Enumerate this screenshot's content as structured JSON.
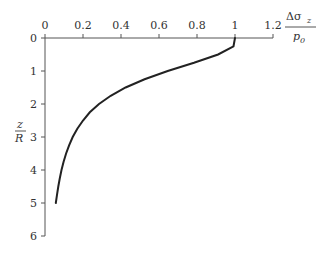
{
  "chart_data": {
    "type": "line",
    "title": "",
    "xlabel": "Δσ_z / p_0",
    "ylabel": "z / R",
    "x_axis_position": "top",
    "y_axis_inverted": true,
    "xlim": [
      0,
      1.2
    ],
    "ylim": [
      0,
      6
    ],
    "x_ticks": [
      "0",
      "0.2",
      "0.4",
      "0.6",
      "0.8",
      "1",
      "1.2"
    ],
    "y_ticks": [
      "0",
      "1",
      "2",
      "3",
      "4",
      "5",
      "6"
    ],
    "grid": false,
    "legend": null,
    "series": [
      {
        "name": "Δσz/p0 vs z/R",
        "x": [
          1.0,
          0.992,
          0.911,
          0.784,
          0.646,
          0.524,
          0.424,
          0.346,
          0.284,
          0.236,
          0.2,
          0.17,
          0.146,
          0.127,
          0.111,
          0.098,
          0.087,
          0.078,
          0.07,
          0.063,
          0.057
        ],
        "y": [
          0.0,
          0.25,
          0.5,
          0.75,
          1.0,
          1.25,
          1.5,
          1.75,
          2.0,
          2.25,
          2.5,
          2.75,
          3.0,
          3.25,
          3.5,
          3.75,
          4.0,
          4.25,
          4.5,
          4.75,
          5.0
        ]
      }
    ]
  },
  "labels": {
    "x_label_num_main": "Δσ",
    "x_label_num_sub": "z",
    "x_label_den_main": "p",
    "x_label_den_sub": "0",
    "y_label_num": "z",
    "y_label_den": "R"
  }
}
